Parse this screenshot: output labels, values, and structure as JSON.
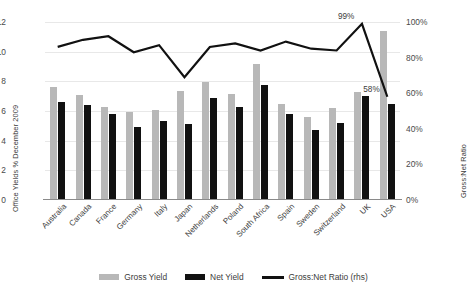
{
  "chart_data": {
    "type": "bar",
    "title": "",
    "xlabel": "",
    "ylabel": "Office Yields % December 2009",
    "y2label": "Gross:Net Ratio",
    "ylim": [
      0,
      12
    ],
    "y2lim": [
      0,
      1.0
    ],
    "grid": true,
    "legend_position": "bottom",
    "categories": [
      "Australia",
      "Canada",
      "France",
      "Germany",
      "Italy",
      "Japan",
      "Netherlands",
      "Poland",
      "South Africa",
      "Spain",
      "Sweden",
      "Switzerland",
      "UK",
      "USA"
    ],
    "y_ticks": [
      "0",
      "2",
      "4",
      "6",
      "8",
      "10",
      "12"
    ],
    "y2_ticks": [
      "0%",
      "20%",
      "40%",
      "60%",
      "80%",
      "100%"
    ],
    "series": [
      {
        "name": "Gross Yield",
        "axis": "left",
        "type": "bar",
        "color": "#b8b8b8",
        "values": [
          7.65,
          7.1,
          6.3,
          5.9,
          6.1,
          7.35,
          7.95,
          7.15,
          9.2,
          6.5,
          5.6,
          6.2,
          7.3,
          11.4
        ]
      },
      {
        "name": "Net Yield",
        "axis": "left",
        "type": "bar",
        "color": "#111111",
        "values": [
          6.6,
          6.4,
          5.8,
          4.9,
          5.3,
          5.1,
          6.85,
          6.3,
          7.75,
          5.8,
          4.75,
          5.2,
          7.0,
          6.5
        ]
      },
      {
        "name": "Gross:Net Ratio (rhs)",
        "axis": "right",
        "type": "line",
        "color": "#111111",
        "values": [
          0.86,
          0.9,
          0.92,
          0.83,
          0.87,
          0.69,
          0.86,
          0.88,
          0.84,
          0.89,
          0.85,
          0.84,
          0.99,
          0.58
        ]
      }
    ],
    "annotations": [
      {
        "label": "99%",
        "category": "UK",
        "series": "Gross:Net Ratio (rhs)",
        "value": 0.99
      },
      {
        "label": "58%",
        "category": "USA",
        "series": "Gross:Net Ratio (rhs)",
        "value": 0.58
      }
    ]
  },
  "legend": {
    "items": [
      {
        "label": "Gross Yield",
        "marker": "bar",
        "color": "#b8b8b8"
      },
      {
        "label": "Net Yield",
        "marker": "bar",
        "color": "#111111"
      },
      {
        "label": "Gross:Net Ratio (rhs)",
        "marker": "line",
        "color": "#111111"
      }
    ]
  }
}
